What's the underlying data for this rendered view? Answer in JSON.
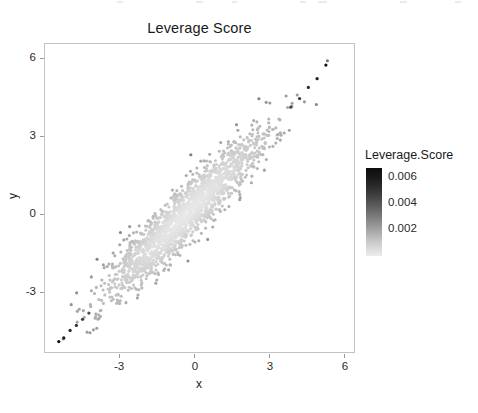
{
  "chart_data": {
    "type": "scatter",
    "title": "Leverage Score",
    "xlabel": "x",
    "ylabel": "y",
    "grid": false,
    "xlim": [
      -5.6,
      6.8
    ],
    "ylim": [
      -5.6,
      6.9
    ],
    "xticks": [
      -3,
      0,
      3,
      6
    ],
    "xtick_labels": [
      "-3",
      "0",
      "3",
      "6"
    ],
    "yticks": [
      -3,
      0,
      3,
      6
    ],
    "ytick_labels": [
      "-3",
      "0",
      "3",
      "6"
    ],
    "colorbar": {
      "title": "Leverage.Score",
      "ticks": [
        0.002,
        0.004,
        0.006
      ],
      "tick_labels": [
        "0.002",
        "0.004",
        "0.006"
      ],
      "vmin": 0.0005,
      "vmax": 0.0072,
      "low_color": "#efefef",
      "high_color": "#101010",
      "orientation": "vertical",
      "position": "right"
    },
    "series": [
      {
        "name": "observations",
        "color_variable": "Leverage.Score",
        "n_points": 2000,
        "description": "Bivariate normal cloud of x vs y with strong positive correlation (r~0.93); point color encodes leverage score, which grows with Mahalanobis distance from the centroid, so the dense pale core has low leverage and the dark extreme tails at the lower-left and upper-right have the highest leverage.",
        "x_mean": 0.0,
        "y_mean": 0.0,
        "x_sd": 1.55,
        "y_sd": 1.62,
        "correlation": 0.93,
        "marker": "filled-circle",
        "marker_size_px": 3.1,
        "notable_high_leverage_points": [
          {
            "x": -5.05,
            "y": -5.1,
            "leverage": 0.0071
          },
          {
            "x": -4.85,
            "y": -4.95,
            "leverage": 0.0068
          },
          {
            "x": -4.6,
            "y": -4.65,
            "leverage": 0.0063
          },
          {
            "x": -4.35,
            "y": -4.45,
            "leverage": 0.0059
          },
          {
            "x": -4.1,
            "y": -4.2,
            "leverage": 0.0055
          },
          {
            "x": -3.85,
            "y": -3.95,
            "leverage": 0.005
          },
          {
            "x": 4.2,
            "y": 4.35,
            "leverage": 0.0052
          },
          {
            "x": 4.55,
            "y": 4.7,
            "leverage": 0.0057
          },
          {
            "x": 4.9,
            "y": 5.15,
            "leverage": 0.0062
          },
          {
            "x": 5.25,
            "y": 5.5,
            "leverage": 0.0066
          },
          {
            "x": 5.6,
            "y": 6.05,
            "leverage": 0.0072
          }
        ]
      }
    ]
  },
  "legend": {
    "title": "Leverage.Score",
    "labels": [
      "0.006",
      "0.004",
      "0.002"
    ]
  },
  "axes": {
    "title": "Leverage Score",
    "xlabel": "x",
    "ylabel": "y",
    "xtick_labels": [
      "-3",
      "0",
      "3",
      "6"
    ],
    "ytick_labels": [
      "6",
      "3",
      "0",
      "-3"
    ]
  }
}
